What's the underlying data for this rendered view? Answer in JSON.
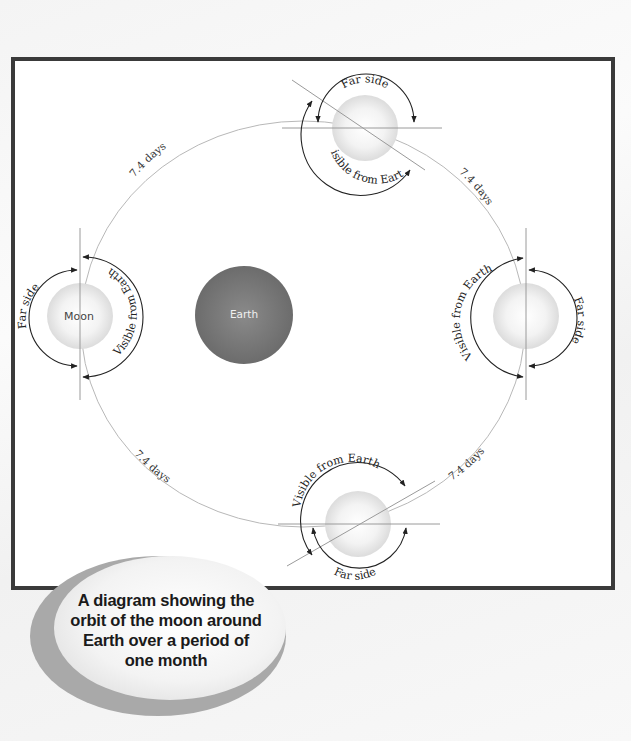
{
  "diagram": {
    "central_body": {
      "label": "Earth",
      "color": "#7a7a7a"
    },
    "orbiting_body_label": "Moon",
    "positions": [
      {
        "id": "top",
        "far_side_label": "Far side",
        "near_side_label": "Visible from Earth"
      },
      {
        "id": "right",
        "far_side_label": "Far side",
        "near_side_label": "Visible from Earth"
      },
      {
        "id": "bottom",
        "far_side_label": "Far side",
        "near_side_label": "Visible from Earth"
      },
      {
        "id": "left",
        "far_side_label": "Far side",
        "near_side_label": "Visible from Earth",
        "moon_label": "Moon"
      }
    ],
    "intervals": [
      {
        "id": "top-left",
        "label": "7.4 days"
      },
      {
        "id": "top-right",
        "label": "7.4 days"
      },
      {
        "id": "bottom-right",
        "label": "7.4 days"
      },
      {
        "id": "bottom-left",
        "label": "7.4 days"
      }
    ],
    "colors": {
      "frame": "#3a3a3a",
      "orbit": "#b8b8b8",
      "moon": "#e6e6e6",
      "earth": "#7a7a7a"
    }
  },
  "caption": {
    "lines": [
      "A diagram showing the",
      "orbit of the moon around",
      "Earth over a period of",
      "one month"
    ]
  }
}
